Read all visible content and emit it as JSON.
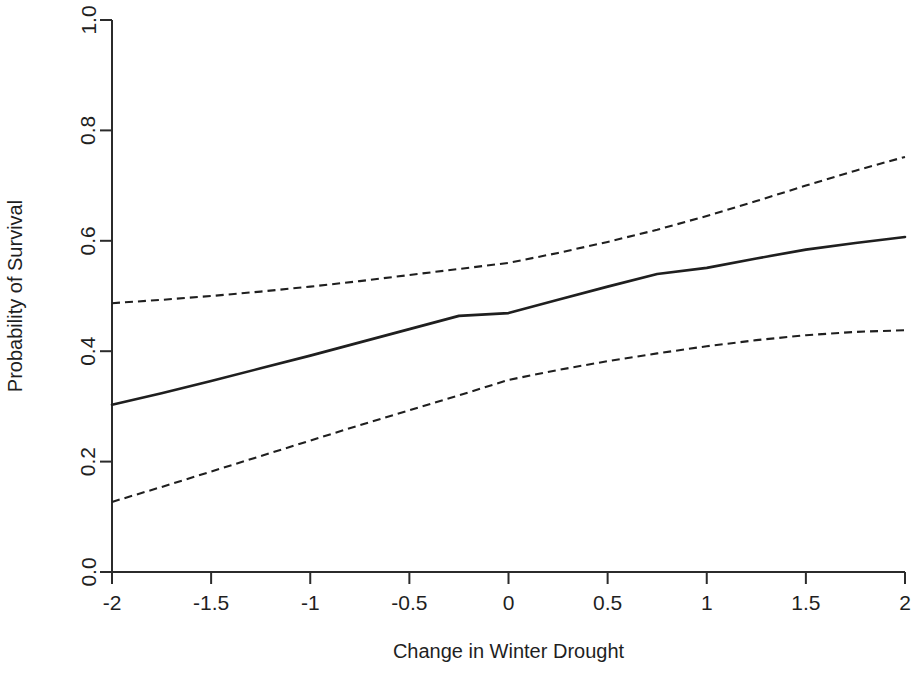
{
  "chart_data": {
    "type": "line",
    "title": "",
    "subtitle": "",
    "xlabel": "Change in Winter Drought",
    "ylabel": "Probability of Survival",
    "xlim": [
      -2,
      2
    ],
    "ylim": [
      0,
      1
    ],
    "xticks": [
      -2,
      -1.5,
      -1,
      -0.5,
      0,
      0.5,
      1,
      1.5,
      2
    ],
    "xticklabels": [
      "-2",
      "-1.5",
      "-1",
      "-0.5",
      "0",
      "0.5",
      "1",
      "1.5",
      "2"
    ],
    "yticks": [
      0,
      0.2,
      0.4,
      0.6,
      0.8,
      1
    ],
    "yticklabels": [
      "0.0",
      "0.2",
      "0.4",
      "0.6",
      "0.8",
      "1.0"
    ],
    "grid": false,
    "legend": null,
    "legend_position": "none",
    "x": [
      -2,
      -1.75,
      -1.5,
      -1.25,
      -1,
      -0.75,
      -0.5,
      -0.25,
      0,
      0.25,
      0.5,
      0.75,
      1,
      1.25,
      1.5,
      1.75,
      2
    ],
    "series": [
      {
        "name": "Fitted probability of survival",
        "style": "solid",
        "color": "#1f1f1f",
        "values": [
          0.303,
          0.324,
          0.346,
          0.369,
          0.392,
          0.416,
          0.44,
          0.464,
          0.469,
          0.493,
          0.517,
          0.54,
          0.551,
          0.568,
          0.584,
          0.596,
          0.607
        ]
      },
      {
        "name": "Upper 95% confidence limit",
        "style": "dashed",
        "color": "#1f1f1f",
        "values": [
          0.487,
          0.493,
          0.5,
          0.508,
          0.517,
          0.527,
          0.538,
          0.549,
          0.56,
          0.578,
          0.598,
          0.62,
          0.645,
          0.672,
          0.7,
          0.727,
          0.752
        ]
      },
      {
        "name": "Lower 95% confidence limit",
        "style": "dashed",
        "color": "#1f1f1f",
        "values": [
          0.127,
          0.154,
          0.182,
          0.21,
          0.238,
          0.266,
          0.293,
          0.32,
          0.348,
          0.366,
          0.382,
          0.396,
          0.409,
          0.42,
          0.429,
          0.435,
          0.438
        ]
      }
    ]
  },
  "axis": {
    "x_title": "Change in Winter Drought",
    "y_title": "Probability of Survival"
  }
}
